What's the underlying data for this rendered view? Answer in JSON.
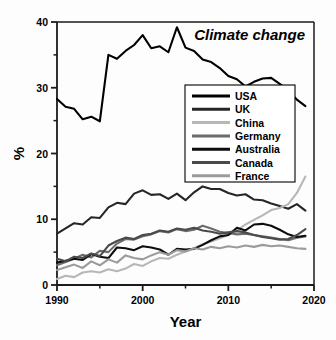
{
  "chart_data": {
    "type": "line",
    "title": "Climate change",
    "xlabel": "Year",
    "ylabel": "%",
    "xlim": [
      1990,
      2020
    ],
    "ylim": [
      0,
      40
    ],
    "xticks": [
      1990,
      2000,
      2010,
      2020
    ],
    "yticks": [
      0,
      10,
      20,
      30,
      40
    ],
    "xminorticks": [
      1995,
      2005,
      2015
    ],
    "yminorticks": [
      5,
      15,
      25,
      35
    ],
    "grid": false,
    "legend_position": "center-right",
    "x": [
      1990,
      1991,
      1992,
      1993,
      1994,
      1995,
      1996,
      1997,
      1998,
      1999,
      2000,
      2001,
      2002,
      2003,
      2004,
      2005,
      2006,
      2007,
      2008,
      2009,
      2010,
      2011,
      2012,
      2013,
      2014,
      2015,
      2016,
      2017,
      2018,
      2019
    ],
    "series": [
      {
        "name": "USA",
        "color": "#000000",
        "values": [
          28.3,
          27.1,
          26.8,
          25.2,
          25.6,
          24.9,
          35.0,
          34.4,
          35.6,
          36.5,
          38.0,
          36.0,
          36.3,
          35.4,
          39.2,
          36.1,
          35.6,
          34.3,
          33.9,
          33.0,
          31.8,
          31.3,
          30.2,
          30.9,
          31.4,
          31.5,
          30.6,
          29.5,
          28.2,
          27.2
        ]
      },
      {
        "name": "UK",
        "color": "#262626",
        "values": [
          7.8,
          8.6,
          9.4,
          9.2,
          10.3,
          10.2,
          11.8,
          12.5,
          12.3,
          13.9,
          14.4,
          13.7,
          13.8,
          13.1,
          13.9,
          12.9,
          14.1,
          15.0,
          14.6,
          14.6,
          14.0,
          13.6,
          13.8,
          13.0,
          12.9,
          12.4,
          12.0,
          11.6,
          12.3,
          11.3
        ]
      },
      {
        "name": "China",
        "color": "#b7b7b7",
        "values": [
          0.9,
          1.4,
          1.2,
          1.9,
          2.1,
          1.9,
          2.4,
          2.1,
          2.5,
          3.2,
          2.9,
          3.6,
          4.1,
          4.0,
          4.6,
          5.1,
          5.6,
          6.2,
          6.6,
          7.1,
          7.6,
          8.3,
          9.2,
          9.9,
          10.6,
          11.4,
          11.7,
          12.3,
          14.0,
          16.5
        ]
      },
      {
        "name": "Germany",
        "color": "#6b6b6b",
        "values": [
          3.0,
          3.5,
          4.0,
          4.6,
          4.2,
          5.2,
          5.0,
          6.3,
          7.0,
          6.9,
          7.4,
          7.7,
          8.2,
          8.0,
          8.5,
          8.2,
          8.4,
          9.0,
          8.6,
          8.1,
          7.9,
          7.7,
          7.8,
          7.6,
          7.4,
          7.2,
          7.0,
          6.8,
          7.2,
          7.4
        ]
      },
      {
        "name": "Australia",
        "color": "#0d0d0d",
        "values": [
          3.4,
          3.7,
          4.0,
          3.8,
          4.7,
          4.3,
          4.1,
          5.7,
          5.6,
          5.3,
          5.9,
          5.7,
          5.4,
          4.6,
          5.5,
          5.4,
          5.5,
          6.1,
          6.8,
          7.4,
          7.6,
          8.7,
          8.3,
          9.2,
          9.3,
          9.0,
          8.4,
          7.7,
          7.3,
          7.5
        ]
      },
      {
        "name": "Canada",
        "color": "#4a4a4a",
        "values": [
          4.0,
          3.6,
          4.3,
          4.1,
          4.8,
          4.4,
          6.0,
          6.7,
          7.2,
          7.0,
          7.6,
          7.8,
          8.3,
          8.1,
          8.6,
          8.4,
          8.7,
          8.3,
          8.1,
          7.8,
          8.0,
          8.2,
          8.0,
          7.6,
          7.3,
          7.1,
          6.9,
          7.0,
          7.6,
          8.5
        ]
      },
      {
        "name": "France",
        "color": "#9b9b9b",
        "values": [
          2.3,
          2.7,
          3.1,
          2.6,
          3.6,
          3.0,
          3.9,
          3.4,
          4.5,
          4.1,
          3.9,
          4.5,
          5.0,
          4.6,
          5.3,
          5.1,
          5.6,
          5.4,
          5.8,
          5.6,
          5.9,
          5.7,
          6.0,
          5.8,
          6.1,
          5.9,
          6.0,
          5.8,
          5.6,
          5.5
        ]
      }
    ]
  },
  "legend": {
    "items": [
      {
        "label": "USA"
      },
      {
        "label": "UK"
      },
      {
        "label": "China"
      },
      {
        "label": "Germany"
      },
      {
        "label": "Australia"
      },
      {
        "label": "Canada"
      },
      {
        "label": "France"
      }
    ]
  }
}
